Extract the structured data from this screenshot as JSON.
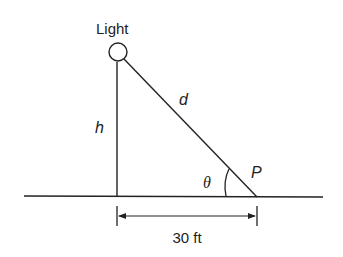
{
  "diagram": {
    "labels": {
      "light": "Light",
      "hypotenuse": "d",
      "height": "h",
      "angle": "θ",
      "point": "P",
      "distance": "30 ft"
    },
    "elements": {
      "light_source": "circle at top of pole",
      "pole": "vertical line of height h",
      "ground": "horizontal ground line",
      "line_of_sight": "segment from light to point P, length d",
      "angle_arc": "angle θ between ground and line d at P",
      "dimension": "horizontal distance from pole base to P"
    },
    "colors": {
      "stroke": "#222222",
      "background": "#ffffff"
    }
  }
}
